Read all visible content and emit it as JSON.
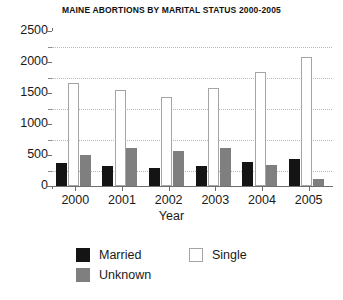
{
  "chart_data": {
    "type": "bar",
    "title": "MAINE ABORTIONS BY MARITAL STATUS 2000-2005",
    "xlabel": "Year",
    "ylabel": "",
    "categories": [
      "2000",
      "2001",
      "2002",
      "2003",
      "2004",
      "2005"
    ],
    "series": [
      {
        "name": "Married",
        "color": "#141414",
        "values": [
          370,
          330,
          290,
          325,
          385,
          440
        ]
      },
      {
        "name": "Unknown",
        "color": "#7f7f7f",
        "values": [
          500,
          610,
          565,
          620,
          345,
          110
        ]
      },
      {
        "name": "Single",
        "color": "#ffffff",
        "values": [
          1660,
          1550,
          1440,
          1580,
          1835,
          2080
        ]
      }
    ],
    "ylim": [
      0,
      2500
    ],
    "ytick_labels": [
      "0",
      "500",
      "1000",
      "1500",
      "2000",
      "2500"
    ],
    "ytick_values": [
      0,
      500,
      1000,
      1500,
      2000,
      2500
    ],
    "minor_tick_values": [
      250,
      750,
      1250,
      1750,
      2250
    ],
    "grid": true,
    "grid_axis": "y",
    "legend_position": "bottom",
    "legend_entries": [
      "Married",
      "Unknown",
      "Single"
    ]
  }
}
